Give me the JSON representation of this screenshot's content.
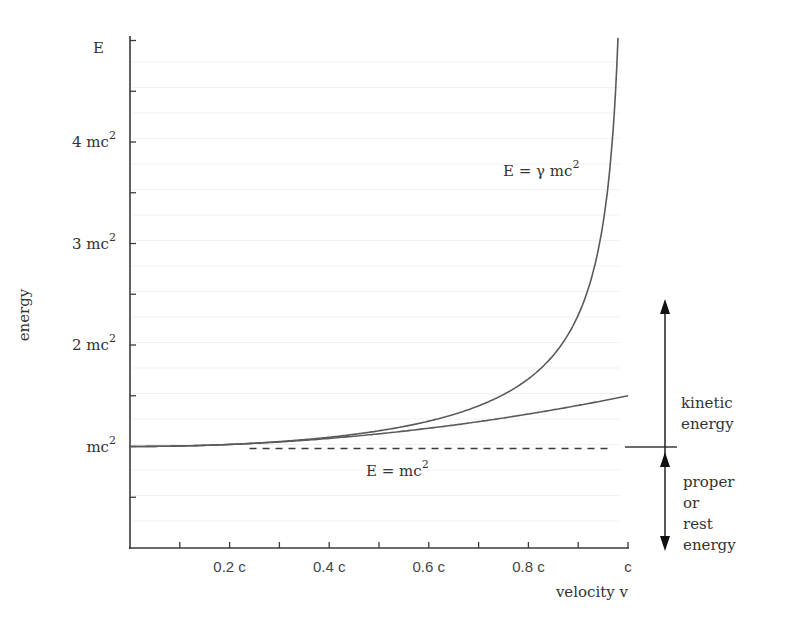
{
  "chart_data": {
    "type": "line",
    "title": "",
    "xlabel": "velocity v",
    "ylabel": "energy",
    "y_axis_top_label": "E",
    "xlim": [
      0,
      1
    ],
    "ylim": [
      0,
      5
    ],
    "grid": false,
    "x_ticks": [
      0.1,
      0.2,
      0.3,
      0.4,
      0.5,
      0.6,
      0.7,
      0.8,
      0.9,
      1.0
    ],
    "x_tick_labels": [
      {
        "value": 0.2,
        "label": "0.2 c"
      },
      {
        "value": 0.4,
        "label": "0.4 c"
      },
      {
        "value": 0.6,
        "label": "0.6 c"
      },
      {
        "value": 0.8,
        "label": "0.8 c"
      },
      {
        "value": 1.0,
        "label": "c"
      }
    ],
    "y_ticks": [
      0.5,
      1,
      1.5,
      2,
      2.5,
      3,
      3.5,
      4,
      4.5,
      5
    ],
    "y_tick_labels": [
      {
        "value": 1,
        "label": "mc",
        "sup": "2"
      },
      {
        "value": 2,
        "label": "2 mc",
        "sup": "2"
      },
      {
        "value": 3,
        "label": "3 mc",
        "sup": "2"
      },
      {
        "value": 4,
        "label": "4 mc",
        "sup": "2"
      },
      {
        "value": 5,
        "label": "E",
        "sup": ""
      }
    ],
    "series": [
      {
        "name": "relativistic total energy",
        "label": "E  = γ mc",
        "label_sup": "2",
        "formula": "gamma",
        "x": [
          0,
          0.1,
          0.2,
          0.3,
          0.4,
          0.5,
          0.6,
          0.7,
          0.8,
          0.85,
          0.9,
          0.93,
          0.95,
          0.96,
          0.97,
          0.98
        ],
        "y": [
          1.0,
          1.005,
          1.021,
          1.048,
          1.091,
          1.155,
          1.25,
          1.4,
          1.667,
          1.898,
          2.294,
          2.721,
          3.203,
          3.571,
          4.113,
          5.025
        ]
      },
      {
        "name": "classical approximation",
        "label": "",
        "formula": "classical",
        "x": [
          0,
          0.1,
          0.2,
          0.3,
          0.4,
          0.5,
          0.6,
          0.7,
          0.8,
          0.9,
          1.0
        ],
        "y": [
          1.0,
          1.005,
          1.02,
          1.045,
          1.08,
          1.125,
          1.18,
          1.245,
          1.32,
          1.405,
          1.5
        ]
      },
      {
        "name": "rest energy",
        "label": "E  = mc",
        "label_sup": "2",
        "style": "dashed",
        "x": [
          0.24,
          0.96
        ],
        "y": [
          1,
          1
        ]
      }
    ],
    "annotations": [
      {
        "text": "kinetic",
        "line2": "energy",
        "arrow": "up",
        "from_y": 1,
        "to_y": 2.5
      },
      {
        "text": "proper",
        "line2": "or",
        "line3": "rest",
        "line4": "energy",
        "arrow": "down",
        "from_y": 1,
        "to_y": 0
      }
    ]
  }
}
